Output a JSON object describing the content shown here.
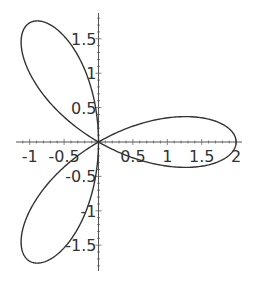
{
  "chart_data": {
    "type": "line",
    "subtype": "polar-parametric",
    "title": "",
    "xlabel": "",
    "ylabel": "",
    "equation": "r = 2 cos(3θ)",
    "series": [
      {
        "name": "three-leaved rose",
        "color": "#333333",
        "param_range": [
          0,
          3.14159
        ]
      }
    ],
    "xlim": [
      -1.2,
      2.08
    ],
    "ylim": [
      -1.86,
      1.88
    ],
    "x_ticks": [
      -1,
      -0.5,
      0.5,
      1,
      1.5,
      2
    ],
    "x_tick_labels": [
      "-1",
      "-0.5",
      "0.5",
      "1",
      "1.5",
      "2"
    ],
    "y_ticks": [
      -1.5,
      -1,
      -0.5,
      0.5,
      1,
      1.5
    ],
    "y_tick_labels": [
      "-1.5",
      "-1",
      "-0.5",
      "0.5",
      "1",
      "1.5"
    ],
    "grid": false,
    "legend": null,
    "axes_origin": [
      0,
      0
    ]
  },
  "style": {
    "axis_color": "#555555",
    "curve_color": "#333333",
    "label_color": "#333333",
    "background": "#ffffff"
  },
  "layout": {
    "origin_px": [
      98.5,
      142
    ],
    "px_per_unit": 68.8,
    "x_axis_px_range": [
      16,
      242
    ],
    "y_axis_px_range": [
      13,
      271
    ]
  }
}
